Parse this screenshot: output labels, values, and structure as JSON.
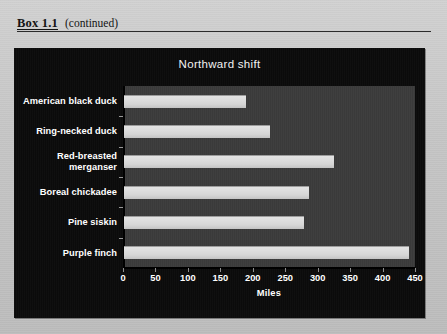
{
  "header": {
    "box_label": "Box 1.1",
    "continued": "(continued)"
  },
  "chart_data": {
    "type": "bar",
    "orientation": "horizontal",
    "title": "Northward shift",
    "xlabel": "Miles",
    "ylabel": "",
    "categories": [
      "American black duck",
      "Ring-necked duck",
      "Red-breasted merganser",
      "Boreal chickadee",
      "Pine siskin",
      "Purple finch"
    ],
    "values": [
      188,
      225,
      324,
      285,
      277,
      439
    ],
    "xlim": [
      0,
      450
    ],
    "xticks": [
      0,
      50,
      100,
      150,
      200,
      250,
      300,
      350,
      400,
      450
    ],
    "grid": false,
    "legend": null,
    "colors": {
      "bar_fill": "#d6d6d6",
      "plot_background": "#3b3b3b",
      "panel_background": "#0b0b0b",
      "text": "#ffffff",
      "page_background": "#c9c9c9"
    }
  }
}
